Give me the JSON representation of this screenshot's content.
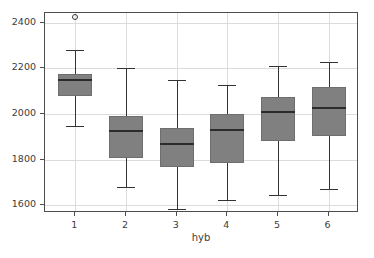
{
  "chart_data": {
    "type": "box",
    "title": "",
    "xlabel": "hyb",
    "ylabel": "",
    "grid": true,
    "legend": "none",
    "xlim": [
      0.4,
      6.6
    ],
    "ylim": [
      1567,
      2443
    ],
    "categories": [
      "1",
      "2",
      "3",
      "4",
      "5",
      "6"
    ],
    "yticks": [
      1600,
      1800,
      2000,
      2200,
      2400
    ],
    "ytick_labels": [
      "1600",
      "1800",
      "2000",
      "2200",
      "2400"
    ],
    "xticks": [
      "1",
      "2",
      "3",
      "4",
      "5",
      "6"
    ],
    "boxes": [
      {
        "category": "1",
        "whisker_low": 1947,
        "q1": 2078,
        "median": 2150,
        "q3": 2177,
        "whisker_high": 2281,
        "outliers": [
          2424
        ]
      },
      {
        "category": "2",
        "whisker_low": 1682,
        "q1": 1810,
        "median": 1924,
        "q3": 1990,
        "whisker_high": 2200,
        "outliers": []
      },
      {
        "category": "3",
        "whisker_low": 1586,
        "q1": 1767,
        "median": 1868,
        "q3": 1941,
        "whisker_high": 2148,
        "outliers": []
      },
      {
        "category": "4",
        "whisker_low": 1625,
        "q1": 1787,
        "median": 1930,
        "q3": 2000,
        "whisker_high": 2126,
        "outliers": []
      },
      {
        "category": "5",
        "whisker_low": 1645,
        "q1": 1881,
        "median": 2009,
        "q3": 2074,
        "whisker_high": 2212,
        "outliers": []
      },
      {
        "category": "6",
        "whisker_low": 1673,
        "q1": 1905,
        "median": 2027,
        "q3": 2117,
        "whisker_high": 2230,
        "outliers": []
      }
    ],
    "colors": {
      "box_fill": "#808080",
      "box_edge": "#6e6e6e",
      "median": "#2b2b2b",
      "whisker": "#333333",
      "grid": "#dcdcdc",
      "frame": "#4d4d4d",
      "background": "#ffffff",
      "tick_text": "#3c3c3c"
    }
  }
}
